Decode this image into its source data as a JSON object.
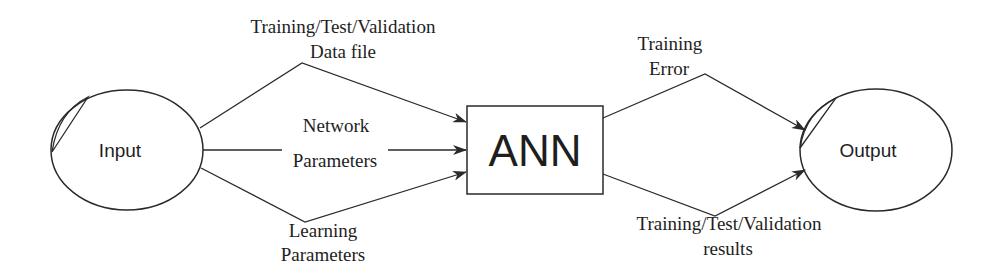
{
  "diagram": {
    "type": "flow",
    "nodes": {
      "input": {
        "label": "Input",
        "shape": "ellipse"
      },
      "ann": {
        "label": "ANN",
        "shape": "rectangle"
      },
      "output": {
        "label": "Output",
        "shape": "ellipse"
      }
    },
    "edges": {
      "data_file": {
        "from": "Input",
        "to": "ANN",
        "line1": "Training/Test/Validation",
        "line2": "Data file"
      },
      "network_params": {
        "from": "Input",
        "to": "ANN",
        "line1": "Network",
        "line2": "Parameters"
      },
      "learning_params": {
        "from": "Input",
        "to": "ANN",
        "line1": "Learning",
        "line2": "Parameters"
      },
      "training_error": {
        "from": "ANN",
        "to": "Output",
        "line1": "Training",
        "line2": "Error"
      },
      "results": {
        "from": "ANN",
        "to": "Output",
        "line1": "Training/Test/Validation",
        "line2": "results"
      }
    },
    "colors": {
      "stroke": "#2a2a2a",
      "text": "#1e1e1e",
      "background": "#ffffff"
    }
  }
}
